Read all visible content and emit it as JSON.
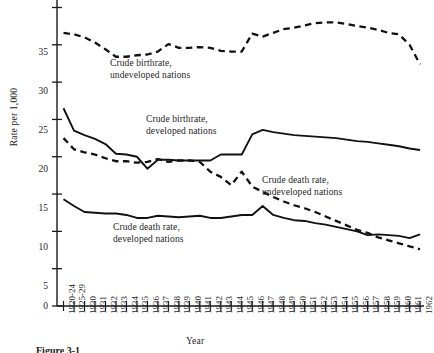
{
  "figure": {
    "caption": "Figure 3-1",
    "ylabel": "Rate per 1,000",
    "xlabel": "Year"
  },
  "chart_data": {
    "type": "line",
    "title": "",
    "xlabel": "Year",
    "ylabel": "Rate per 1,000",
    "ylim": [
      0,
      40
    ],
    "yticks": [
      0,
      5,
      10,
      15,
      20,
      25,
      30,
      35,
      40
    ],
    "grid": false,
    "legend_position": "inline-annotations",
    "categories": [
      "1920-24",
      "1925-29",
      "1930",
      "1931",
      "1932",
      "1933",
      "1934",
      "1935",
      "1936",
      "1937",
      "1938",
      "1939",
      "1940",
      "1941",
      "1942",
      "1943",
      "1944",
      "1945",
      "1946",
      "1947",
      "1948",
      "1949",
      "1950",
      "1951",
      "1952",
      "1953",
      "1954",
      "1955",
      "1956",
      "1957",
      "1958",
      "1959",
      "1960",
      "1961",
      "1962"
    ],
    "series": [
      {
        "name": "Crude birthrate, undeveloped nations",
        "style": "dashed",
        "values": [
          36.6,
          36.4,
          36.0,
          35.3,
          34.4,
          33.4,
          33.4,
          33.6,
          33.7,
          34.1,
          35.1,
          34.6,
          34.6,
          34.7,
          34.6,
          34.2,
          34.1,
          34.1,
          36.5,
          36.1,
          36.6,
          37.1,
          37.3,
          37.6,
          37.9,
          38.0,
          38.0,
          37.8,
          37.5,
          37.3,
          37.0,
          36.6,
          36.4,
          35.0,
          32.4
        ]
      },
      {
        "name": "Crude birthrate, developed nations",
        "style": "solid",
        "values": [
          26.5,
          23.5,
          22.9,
          22.4,
          21.7,
          20.4,
          20.3,
          20.0,
          18.4,
          19.6,
          19.6,
          19.5,
          19.5,
          19.5,
          19.5,
          20.3,
          20.3,
          20.3,
          23.0,
          23.6,
          23.3,
          23.1,
          22.9,
          22.8,
          22.7,
          22.6,
          22.5,
          22.3,
          22.1,
          22.0,
          21.8,
          21.6,
          21.4,
          21.1,
          20.9
        ]
      },
      {
        "name": "Crude death rate, undeveloped nations",
        "style": "dashed",
        "values": [
          22.5,
          21.0,
          20.6,
          20.3,
          19.8,
          19.4,
          19.4,
          19.2,
          19.3,
          19.7,
          19.3,
          19.5,
          19.5,
          19.3,
          18.0,
          17.3,
          16.2,
          18.0,
          16.0,
          15.3,
          14.6,
          14.0,
          13.5,
          13.1,
          12.6,
          12.0,
          11.4,
          10.8,
          10.2,
          9.8,
          9.2,
          8.8,
          8.4,
          8.0,
          7.6
        ]
      },
      {
        "name": "Crude death rate, developed nations",
        "style": "solid",
        "values": [
          14.3,
          13.4,
          12.6,
          12.5,
          12.4,
          12.4,
          12.2,
          11.8,
          11.8,
          12.1,
          12.0,
          11.9,
          12.0,
          12.1,
          11.8,
          11.8,
          12.0,
          12.2,
          12.2,
          13.4,
          12.2,
          11.8,
          11.5,
          11.4,
          11.1,
          10.9,
          10.6,
          10.3,
          10.0,
          9.5,
          9.6,
          9.5,
          9.4,
          9.1,
          9.6
        ]
      }
    ],
    "annotations": [
      {
        "text_line1": "Crude birthrate,",
        "text_line2": "undeveloped nations",
        "x": 110,
        "y": 58
      },
      {
        "text_line1": "Crude birthrate,",
        "text_line2": "developed nations",
        "x": 146,
        "y": 114
      },
      {
        "text_line1": "Crude death rate,",
        "text_line2": "undeveloped nations",
        "x": 262,
        "y": 175
      },
      {
        "text_line1": "Crude death rate,",
        "text_line2": "developed nations",
        "x": 113,
        "y": 222
      }
    ]
  },
  "yticks": {
    "t0": "0",
    "t5": "5",
    "t10": "10",
    "t15": "15",
    "t20": "20",
    "t25": "25",
    "t30": "30",
    "t35": "35",
    "t40": "40"
  }
}
